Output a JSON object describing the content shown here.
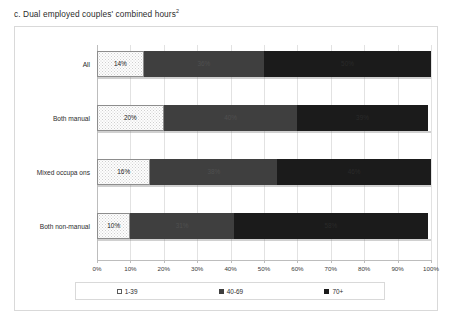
{
  "title": {
    "text": "c. Dual employed couples' combined hours",
    "footnote_marker": "2"
  },
  "colors": {
    "series_1_39": "#ffffff",
    "series_40_69": "#3f3f3f",
    "series_70_plus": "#1b1b1b",
    "gridline": "#e2e2e2",
    "frame": "#d9d9d9"
  },
  "chart_data": {
    "type": "bar",
    "orientation": "horizontal",
    "stacked": true,
    "stack_total": 100,
    "title": "c. Dual employed couples' combined hours",
    "xlabel": "",
    "ylabel": "",
    "xlim": [
      0,
      100
    ],
    "grid": true,
    "legend_position": "bottom",
    "categories": [
      "All",
      "Both manual",
      "Mixed occupa ons",
      "Both non-manual"
    ],
    "x_tick_labels": [
      "0%",
      "10%",
      "20%",
      "30%",
      "40%",
      "50%",
      "60%",
      "70%",
      "80%",
      "90%",
      "100%"
    ],
    "x_ticks": [
      0,
      10,
      20,
      30,
      40,
      50,
      60,
      70,
      80,
      90,
      100
    ],
    "series": [
      {
        "name": "1-39",
        "values": [
          14,
          20,
          16,
          10
        ],
        "labels": [
          "14%",
          "20%",
          "16%",
          "10%"
        ]
      },
      {
        "name": "40-69",
        "values": [
          36,
          40,
          38,
          31
        ],
        "labels": [
          "36%",
          "40%",
          "38%",
          "31%"
        ]
      },
      {
        "name": "70+",
        "values": [
          50,
          39,
          46,
          58
        ],
        "labels": [
          "50%",
          "39%",
          "46%",
          "58%"
        ]
      }
    ]
  },
  "legend": {
    "items": [
      {
        "label": "1-39"
      },
      {
        "label": "40-69"
      },
      {
        "label": "70+"
      }
    ]
  }
}
